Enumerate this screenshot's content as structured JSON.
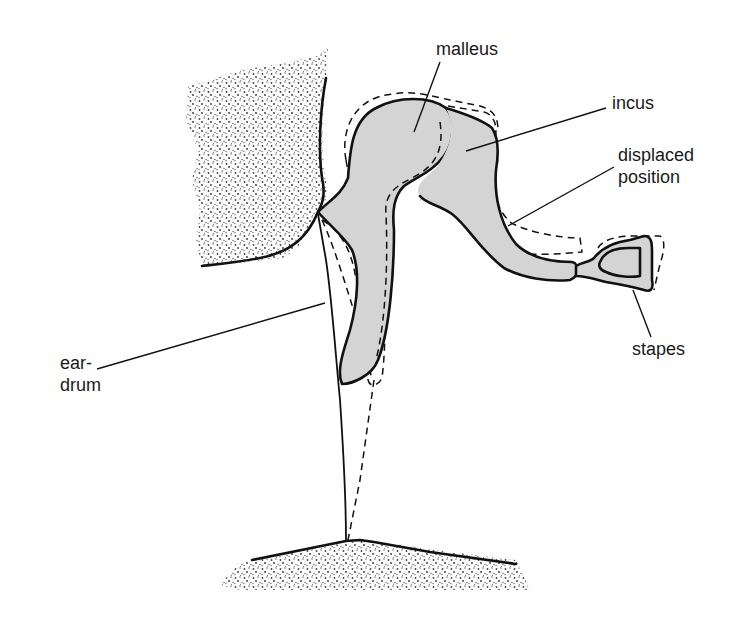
{
  "diagram": {
    "labels": {
      "malleus": "malleus",
      "incus": "incus",
      "displaced": "displaced\nposition",
      "stapes": "stapes",
      "eardrum": "ear-\ndrum"
    },
    "colors": {
      "ink": "#111111",
      "bone_fill": "#d4d4d4",
      "stipple": "#555555",
      "background": "#ffffff"
    },
    "legend": {
      "solid_line": "resting position",
      "dashed_line": "displaced position"
    }
  }
}
